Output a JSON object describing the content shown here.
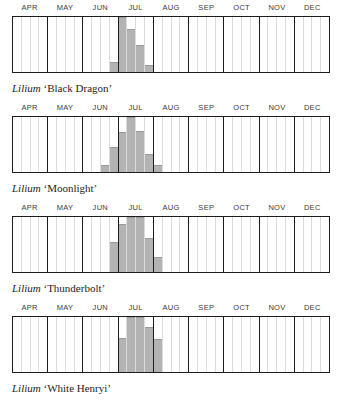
{
  "months": [
    "APR",
    "MAY",
    "JUN",
    "JUL",
    "AUG",
    "SEP",
    "OCT",
    "NOV",
    "DEC"
  ],
  "weeks_per_month": 4,
  "colors": {
    "bar": "#b3b3b3",
    "frame": "#1d1d1d",
    "week_gridline": "#dcdcdc",
    "label": "#3a3a3a",
    "background": "#ffffff"
  },
  "charts": [
    {
      "genus": "Lilium",
      "cultivar": "‘Black Dragon’",
      "caption": "Lilium ‘Black Dragon’",
      "chart_data": {
        "type": "bar",
        "title": "Lilium ‘Black Dragon’ bloom period",
        "xlabel": "",
        "ylabel": "Bloom intensity",
        "ylim": [
          0,
          100
        ],
        "categories": [
          "APR w1",
          "APR w2",
          "APR w3",
          "APR w4",
          "MAY w1",
          "MAY w2",
          "MAY w3",
          "MAY w4",
          "JUN w1",
          "JUN w2",
          "JUN w3",
          "JUN w4",
          "JUL w1",
          "JUL w2",
          "JUL w3",
          "JUL w4",
          "AUG w1",
          "AUG w2",
          "AUG w3",
          "AUG w4",
          "SEP w1",
          "SEP w2",
          "SEP w3",
          "SEP w4",
          "OCT w1",
          "OCT w2",
          "OCT w3",
          "OCT w4",
          "NOV w1",
          "NOV w2",
          "NOV w3",
          "NOV w4",
          "DEC w1",
          "DEC w2",
          "DEC w3",
          "DEC w4"
        ],
        "values": [
          0,
          0,
          0,
          0,
          0,
          0,
          0,
          0,
          0,
          0,
          0,
          18,
          100,
          78,
          50,
          12,
          0,
          0,
          0,
          0,
          0,
          0,
          0,
          0,
          0,
          0,
          0,
          0,
          0,
          0,
          0,
          0,
          0,
          0,
          0,
          0
        ]
      }
    },
    {
      "genus": "Lilium",
      "cultivar": "‘Moonlight’",
      "caption": "Lilium ‘Moonlight’",
      "chart_data": {
        "type": "bar",
        "title": "Lilium ‘Moonlight’ bloom period",
        "xlabel": "",
        "ylabel": "Bloom intensity",
        "ylim": [
          0,
          100
        ],
        "categories": [
          "APR w1",
          "APR w2",
          "APR w3",
          "APR w4",
          "MAY w1",
          "MAY w2",
          "MAY w3",
          "MAY w4",
          "JUN w1",
          "JUN w2",
          "JUN w3",
          "JUN w4",
          "JUL w1",
          "JUL w2",
          "JUL w3",
          "JUL w4",
          "AUG w1",
          "AUG w2",
          "AUG w3",
          "AUG w4",
          "SEP w1",
          "SEP w2",
          "SEP w3",
          "SEP w4",
          "OCT w1",
          "OCT w2",
          "OCT w3",
          "OCT w4",
          "NOV w1",
          "NOV w2",
          "NOV w3",
          "NOV w4",
          "DEC w1",
          "DEC w2",
          "DEC w3",
          "DEC w4"
        ],
        "values": [
          0,
          0,
          0,
          0,
          0,
          0,
          0,
          0,
          0,
          0,
          12,
          45,
          72,
          100,
          75,
          32,
          12,
          0,
          0,
          0,
          0,
          0,
          0,
          0,
          0,
          0,
          0,
          0,
          0,
          0,
          0,
          0,
          0,
          0,
          0,
          0
        ]
      }
    },
    {
      "genus": "Lilium",
      "cultivar": "‘Thunderbolt’",
      "caption": "Lilium ‘Thunderbolt’",
      "chart_data": {
        "type": "bar",
        "title": "Lilium ‘Thunderbolt’ bloom period",
        "xlabel": "",
        "ylabel": "Bloom intensity",
        "ylim": [
          0,
          100
        ],
        "categories": [
          "APR w1",
          "APR w2",
          "APR w3",
          "APR w4",
          "MAY w1",
          "MAY w2",
          "MAY w3",
          "MAY w4",
          "JUN w1",
          "JUN w2",
          "JUN w3",
          "JUN w4",
          "JUL w1",
          "JUL w2",
          "JUL w3",
          "JUL w4",
          "AUG w1",
          "AUG w2",
          "AUG w3",
          "AUG w4",
          "SEP w1",
          "SEP w2",
          "SEP w3",
          "SEP w4",
          "OCT w1",
          "OCT w2",
          "OCT w3",
          "OCT w4",
          "NOV w1",
          "NOV w2",
          "NOV w3",
          "NOV w4",
          "DEC w1",
          "DEC w2",
          "DEC w3",
          "DEC w4"
        ],
        "values": [
          0,
          0,
          0,
          0,
          0,
          0,
          0,
          0,
          0,
          0,
          0,
          55,
          88,
          100,
          100,
          62,
          28,
          0,
          0,
          0,
          0,
          0,
          0,
          0,
          0,
          0,
          0,
          0,
          0,
          0,
          0,
          0,
          0,
          0,
          0,
          0
        ]
      }
    },
    {
      "genus": "Lilium",
      "cultivar": "‘White Henryi’",
      "caption": "Lilium ‘White Henryi’",
      "chart_data": {
        "type": "bar",
        "title": "Lilium ‘White Henryi’ bloom period",
        "xlabel": "",
        "ylabel": "Bloom intensity",
        "ylim": [
          0,
          100
        ],
        "categories": [
          "APR w1",
          "APR w2",
          "APR w3",
          "APR w4",
          "MAY w1",
          "MAY w2",
          "MAY w3",
          "MAY w4",
          "JUN w1",
          "JUN w2",
          "JUN w3",
          "JUN w4",
          "JUL w1",
          "JUL w2",
          "JUL w3",
          "JUL w4",
          "AUG w1",
          "AUG w2",
          "AUG w3",
          "AUG w4",
          "SEP w1",
          "SEP w2",
          "SEP w3",
          "SEP w4",
          "OCT w1",
          "OCT w2",
          "OCT w3",
          "OCT w4",
          "NOV w1",
          "NOV w2",
          "NOV w3",
          "NOV w4",
          "DEC w1",
          "DEC w2",
          "DEC w3",
          "DEC w4"
        ],
        "values": [
          0,
          0,
          0,
          0,
          0,
          0,
          0,
          0,
          0,
          0,
          0,
          0,
          62,
          100,
          100,
          82,
          60,
          0,
          0,
          0,
          0,
          0,
          0,
          0,
          0,
          0,
          0,
          0,
          0,
          0,
          0,
          0,
          0,
          0,
          0,
          0
        ]
      }
    }
  ]
}
